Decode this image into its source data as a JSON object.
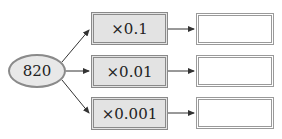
{
  "start": {
    "value": "820"
  },
  "operations": [
    {
      "label": "×0.1",
      "answer": ""
    },
    {
      "label": "×0.01",
      "answer": ""
    },
    {
      "label": "×0.001",
      "answer": ""
    }
  ]
}
